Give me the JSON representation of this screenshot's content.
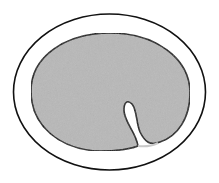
{
  "diagram": {
    "elements": [
      {
        "id": "outer-boundary",
        "label": "Outer boundary (unshaded ring)"
      },
      {
        "id": "inner-body",
        "label": "Inner shaded body"
      },
      {
        "id": "invagination",
        "label": "Inward fold / invagination at lower right"
      }
    ],
    "colors": {
      "background": "#ffffff",
      "outline": "#111111",
      "fill": "#b8b8b8",
      "ring": "#ffffff"
    }
  }
}
